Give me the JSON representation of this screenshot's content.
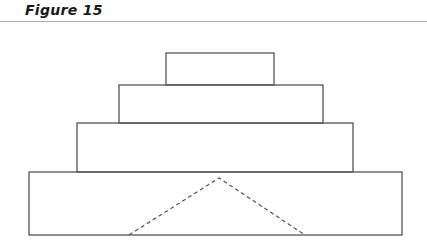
{
  "figure": {
    "title": "Figure 15"
  },
  "diagram": {
    "stroke_color": "#555555",
    "tiers": [
      {
        "name": "top-block",
        "x": 166,
        "y": 53,
        "width": 108,
        "height": 32
      },
      {
        "name": "second-block",
        "x": 119,
        "y": 85,
        "width": 204,
        "height": 38
      },
      {
        "name": "third-block",
        "x": 77,
        "y": 123,
        "width": 276,
        "height": 49
      },
      {
        "name": "base-block",
        "x": 29,
        "y": 172,
        "width": 373,
        "height": 63
      }
    ],
    "dashed_triangle": {
      "left": [
        129,
        235
      ],
      "apex": [
        219,
        178
      ],
      "right": [
        305,
        235
      ]
    }
  }
}
